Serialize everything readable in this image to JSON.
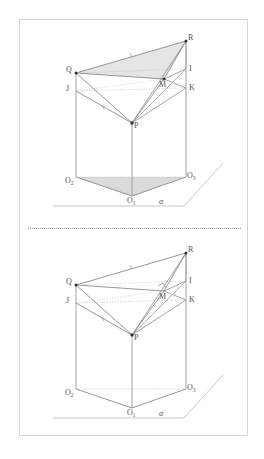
{
  "page": {
    "background_color": "#ffffff",
    "frame_border_color": "#d6d6d6",
    "width": 264,
    "height": 459
  },
  "divider": {
    "style": "dotted",
    "color": "#9a9a9a"
  },
  "figures": [
    {
      "id": "figure-top",
      "shaded": true,
      "right_angle_mark": false,
      "labels": {
        "R": "R",
        "I": "I",
        "K": "K",
        "M": "M",
        "Q": "Q",
        "J": "J",
        "P": "P",
        "O_left": "O",
        "O_left_sub": "2",
        "O_right": "O",
        "O_right_sub": "3",
        "O_bottom": "O",
        "O_bottom_sub": "1",
        "plane": "α"
      }
    },
    {
      "id": "figure-bottom",
      "shaded": false,
      "right_angle_mark": true,
      "labels": {
        "R": "R",
        "I": "I",
        "K": "K",
        "M": "M",
        "Q": "Q",
        "J": "J",
        "P": "P",
        "O_left": "O",
        "O_left_sub": "2",
        "O_right": "O",
        "O_right_sub": "3",
        "O_bottom": "O",
        "O_bottom_sub": "1",
        "plane": "α"
      }
    }
  ],
  "colors": {
    "stroke": "#6f6f6f",
    "stroke_light": "#a8a8a8",
    "dotted": "#b4b4b4",
    "shade_fill": "#d9d9d9",
    "vertex": "#333333",
    "label": "#555555"
  }
}
